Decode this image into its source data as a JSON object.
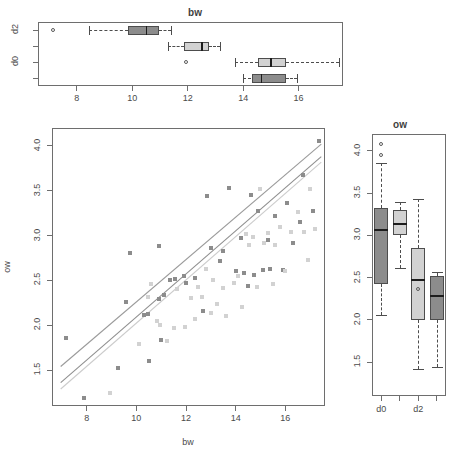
{
  "figure": {
    "background": "#ffffff",
    "dark_gray": "#8c8c8c",
    "light_gray": "#d2d2d2",
    "frame_color": "#6e6e6e",
    "median_color": "#1d1d1d"
  },
  "top_panel": {
    "title": "bw",
    "y_tick_labels": [
      "d2",
      "d0"
    ],
    "x_tick_labels": [
      "8",
      "10",
      "12",
      "14",
      "16"
    ],
    "x_ticks": [
      8,
      10,
      12,
      14,
      16
    ]
  },
  "main_panel": {
    "x_label": "bw",
    "y_label": "ow",
    "x_tick_labels": [
      "8",
      "10",
      "12",
      "14",
      "16"
    ],
    "x_ticks": [
      8,
      10,
      12,
      14,
      16
    ],
    "y_tick_labels": [
      "1.5",
      "2.0",
      "2.5",
      "3.0",
      "3.5",
      "4.0"
    ],
    "y_ticks": [
      1.5,
      2.0,
      2.5,
      3.0,
      3.5,
      4.0
    ]
  },
  "right_panel": {
    "title": "ow",
    "x_tick_labels": [
      "d0",
      "d2"
    ],
    "y_tick_labels": [
      "1.5",
      "2.0",
      "2.5",
      "3.0",
      "3.5",
      "4.0"
    ],
    "y_ticks": [
      1.5,
      2.0,
      2.5,
      3.0,
      3.5,
      4.0
    ]
  },
  "chart_data": {
    "type": "scatter",
    "title": "",
    "xlabel": "bw",
    "ylabel": "ow",
    "xlim": [
      6.6,
      17.6
    ],
    "ylim": [
      1.1,
      4.2
    ],
    "grid": false,
    "legend": "none",
    "series": [
      {
        "name": "group-dark",
        "color": "#8c8c8c",
        "points": [
          [
            7.15,
            1.86
          ],
          [
            7.9,
            1.19
          ],
          [
            9.25,
            1.52
          ],
          [
            9.6,
            2.26
          ],
          [
            9.75,
            2.81
          ],
          [
            10.3,
            2.11
          ],
          [
            10.45,
            2.13
          ],
          [
            10.5,
            1.6
          ],
          [
            10.9,
            2.88
          ],
          [
            10.9,
            2.29
          ],
          [
            11.0,
            1.84
          ],
          [
            11.1,
            2.34
          ],
          [
            11.35,
            2.51
          ],
          [
            11.55,
            2.52
          ],
          [
            11.9,
            2.55
          ],
          [
            12.0,
            2.47
          ],
          [
            12.35,
            2.53
          ],
          [
            12.7,
            2.16
          ],
          [
            12.85,
            3.44
          ],
          [
            13.0,
            2.86
          ],
          [
            13.35,
            2.72
          ],
          [
            13.5,
            2.83
          ],
          [
            13.75,
            3.53
          ],
          [
            14.0,
            2.6
          ],
          [
            14.2,
            2.97
          ],
          [
            14.35,
            2.58
          ],
          [
            14.5,
            2.44
          ],
          [
            14.6,
            3.45
          ],
          [
            14.75,
            2.56
          ],
          [
            14.9,
            3.28
          ],
          [
            15.1,
            2.62
          ],
          [
            15.3,
            2.95
          ],
          [
            15.4,
            2.63
          ],
          [
            15.6,
            3.22
          ],
          [
            15.9,
            2.62
          ],
          [
            16.05,
            3.36
          ],
          [
            16.3,
            2.92
          ],
          [
            16.6,
            3.15
          ],
          [
            16.7,
            3.68
          ],
          [
            17.1,
            3.28
          ],
          [
            17.35,
            4.06
          ]
        ]
      },
      {
        "name": "group-light",
        "color": "#d2d2d2",
        "points": [
          [
            8.95,
            1.25
          ],
          [
            10.1,
            1.79
          ],
          [
            10.45,
            2.32
          ],
          [
            10.6,
            2.46
          ],
          [
            10.85,
            2.05
          ],
          [
            10.95,
            2.0
          ],
          [
            11.25,
            1.83
          ],
          [
            11.5,
            1.97
          ],
          [
            11.65,
            2.4
          ],
          [
            11.95,
            1.98
          ],
          [
            12.2,
            2.3
          ],
          [
            12.35,
            2.07
          ],
          [
            12.5,
            2.43
          ],
          [
            12.65,
            2.31
          ],
          [
            12.8,
            2.63
          ],
          [
            13.0,
            2.14
          ],
          [
            13.1,
            2.5
          ],
          [
            13.25,
            2.24
          ],
          [
            13.5,
            2.42
          ],
          [
            13.6,
            2.1
          ],
          [
            13.95,
            2.47
          ],
          [
            14.1,
            2.55
          ],
          [
            14.25,
            2.2
          ],
          [
            14.4,
            3.02
          ],
          [
            14.55,
            2.9
          ],
          [
            14.7,
            2.98
          ],
          [
            14.85,
            2.43
          ],
          [
            15.0,
            3.52
          ],
          [
            15.15,
            2.92
          ],
          [
            15.3,
            3.03
          ],
          [
            15.5,
            2.46
          ],
          [
            15.6,
            2.9
          ],
          [
            15.8,
            3.1
          ],
          [
            16.0,
            2.6
          ],
          [
            16.25,
            3.04
          ],
          [
            16.5,
            3.26
          ],
          [
            16.75,
            3.04
          ],
          [
            17.0,
            3.52
          ],
          [
            17.2,
            3.07
          ],
          [
            16.9,
            2.73
          ]
        ]
      }
    ],
    "fit_lines": [
      {
        "name": "line-upper-dark",
        "color": "#9a9a9a",
        "x1": 6.95,
        "y1": 1.54,
        "x2": 17.45,
        "y2": 4.02
      },
      {
        "name": "line-mid-dark",
        "color": "#8f8f8f",
        "x1": 6.95,
        "y1": 1.36,
        "x2": 17.45,
        "y2": 3.88
      },
      {
        "name": "line-lower-light",
        "color": "#cccccc",
        "x1": 6.95,
        "y1": 1.29,
        "x2": 17.45,
        "y2": 3.82
      }
    ]
  },
  "boxplots_bw": {
    "orientation": "horizontal",
    "axis_label": "bw",
    "boxes": [
      {
        "name": "bw-box-1",
        "fill": "#8c8c8c",
        "row": 1,
        "min": 8.45,
        "q1": 9.85,
        "median": 10.5,
        "q3": 10.95,
        "max": 11.4,
        "outliers": [
          7.15
        ]
      },
      {
        "name": "bw-box-2",
        "fill": "#d2d2d2",
        "row": 2,
        "min": 11.3,
        "q1": 11.85,
        "median": 12.5,
        "q3": 12.75,
        "max": 13.15,
        "outliers": []
      },
      {
        "name": "bw-box-3",
        "fill": "#d2d2d2",
        "row": 3,
        "min": 13.7,
        "q1": 14.55,
        "median": 15.0,
        "q3": 15.55,
        "max": 17.45,
        "outliers": [
          11.95
        ]
      },
      {
        "name": "bw-box-4",
        "fill": "#8c8c8c",
        "row": 4,
        "min": 14.0,
        "q1": 14.3,
        "median": 14.65,
        "q3": 15.55,
        "max": 15.95,
        "outliers": []
      }
    ]
  },
  "boxplots_ow": {
    "orientation": "vertical",
    "axis_label": "ow",
    "boxes": [
      {
        "name": "ow-box-1",
        "fill": "#8c8c8c",
        "col": 1,
        "min": 2.06,
        "q1": 2.42,
        "median": 3.06,
        "q3": 3.33,
        "max": 3.86,
        "outliers": [
          4.08,
          3.95
        ]
      },
      {
        "name": "ow-box-2",
        "fill": "#d2d2d2",
        "col": 2,
        "min": 2.62,
        "q1": 3.0,
        "median": 3.14,
        "q3": 3.3,
        "max": 3.4,
        "outliers": []
      },
      {
        "name": "ow-box-3",
        "fill": "#d2d2d2",
        "col": 3,
        "min": 1.42,
        "q1": 2.0,
        "median": 2.47,
        "q3": 2.85,
        "max": 3.43,
        "outliers": [
          2.37
        ]
      },
      {
        "name": "ow-box-4",
        "fill": "#8c8c8c",
        "col": 4,
        "min": 1.44,
        "q1": 2.0,
        "median": 2.28,
        "q3": 2.52,
        "max": 2.57,
        "outliers": []
      }
    ]
  }
}
